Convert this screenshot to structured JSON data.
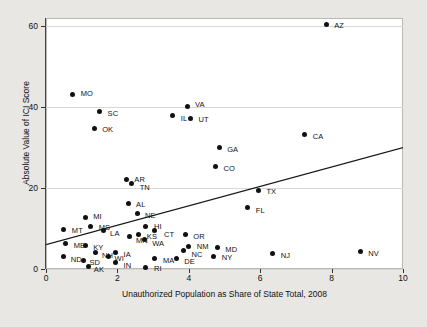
{
  "chart_data": {
    "type": "scatter",
    "title": "",
    "xlabel": "Unauthorized Population as Share of State Total, 2008",
    "ylabel": "Absolute Value of ICI Score",
    "xlim": [
      0,
      10
    ],
    "ylim": [
      0,
      62
    ],
    "xticks": [
      0,
      2,
      4,
      6,
      8,
      10
    ],
    "yticks": [
      0,
      20,
      40,
      60
    ],
    "xtick_labels": [
      "0",
      "2",
      "4",
      "6",
      "8",
      "10"
    ],
    "ytick_labels": [
      "0",
      "20",
      "40",
      "60"
    ],
    "grid": "horizontal",
    "legend": "none",
    "point_label_field": "state",
    "points": [
      {
        "state": "AZ",
        "x": 7.85,
        "y": 60.5,
        "lx": 8,
        "ly": 2
      },
      {
        "state": "MO",
        "x": 0.75,
        "y": 43.0,
        "lx": 8,
        "ly": -1
      },
      {
        "state": "VA",
        "x": 3.95,
        "y": 40.2,
        "lx": 8,
        "ly": -1
      },
      {
        "state": "SC",
        "x": 1.5,
        "y": 38.8,
        "lx": 8,
        "ly": 2
      },
      {
        "state": "IL",
        "x": 3.55,
        "y": 38.0,
        "lx": 8,
        "ly": 4
      },
      {
        "state": "UT",
        "x": 4.05,
        "y": 37.2,
        "lx": 8,
        "ly": 2
      },
      {
        "state": "OK",
        "x": 1.35,
        "y": 34.8,
        "lx": 8,
        "ly": 2
      },
      {
        "state": "CA",
        "x": 7.25,
        "y": 33.2,
        "lx": 8,
        "ly": 2
      },
      {
        "state": "GA",
        "x": 4.85,
        "y": 30.0,
        "lx": 8,
        "ly": 2
      },
      {
        "state": "CO",
        "x": 4.75,
        "y": 25.2,
        "lx": 8,
        "ly": 2
      },
      {
        "state": "AR",
        "x": 2.25,
        "y": 22.0,
        "lx": 8,
        "ly": 0
      },
      {
        "state": "TN",
        "x": 2.4,
        "y": 21.0,
        "lx": 8,
        "ly": 4
      },
      {
        "state": "TX",
        "x": 5.95,
        "y": 19.5,
        "lx": 8,
        "ly": 2
      },
      {
        "state": "AL",
        "x": 2.3,
        "y": 16.2,
        "lx": 8,
        "ly": 2
      },
      {
        "state": "FL",
        "x": 5.65,
        "y": 15.2,
        "lx": 8,
        "ly": 4
      },
      {
        "state": "NE",
        "x": 2.55,
        "y": 13.8,
        "lx": 8,
        "ly": 3
      },
      {
        "state": "MI",
        "x": 1.1,
        "y": 12.8,
        "lx": 8,
        "ly": 0
      },
      {
        "state": "MS",
        "x": 1.25,
        "y": 10.5,
        "lx": 8,
        "ly": 2
      },
      {
        "state": "HI",
        "x": 2.8,
        "y": 10.5,
        "lx": 8,
        "ly": 1
      },
      {
        "state": "CT",
        "x": 3.05,
        "y": 9.5,
        "lx": 9,
        "ly": 4
      },
      {
        "state": "MT",
        "x": 0.5,
        "y": 9.8,
        "lx": 8,
        "ly": 2
      },
      {
        "state": "LA",
        "x": 1.6,
        "y": 9.6,
        "lx": 7,
        "ly": 4
      },
      {
        "state": "KS",
        "x": 2.6,
        "y": 8.5,
        "lx": 8,
        "ly": 2
      },
      {
        "state": "OR",
        "x": 3.9,
        "y": 8.5,
        "lx": 8,
        "ly": 2
      },
      {
        "state": "MN",
        "x": 2.35,
        "y": 8.0,
        "lx": 6,
        "ly": 4
      },
      {
        "state": "WA",
        "x": 2.75,
        "y": 7.2,
        "lx": 8,
        "ly": 4
      },
      {
        "state": "ME",
        "x": 0.55,
        "y": 6.2,
        "lx": 8,
        "ly": 2
      },
      {
        "state": "KY",
        "x": 1.1,
        "y": 5.8,
        "lx": 8,
        "ly": 2
      },
      {
        "state": "NM",
        "x": 4.0,
        "y": 5.5,
        "lx": 8,
        "ly": 0
      },
      {
        "state": "MD",
        "x": 4.8,
        "y": 5.2,
        "lx": 8,
        "ly": 2
      },
      {
        "state": "NV",
        "x": 8.8,
        "y": 4.2,
        "lx": 8,
        "ly": 2
      },
      {
        "state": "NC",
        "x": 3.85,
        "y": 4.5,
        "lx": 8,
        "ly": 4
      },
      {
        "state": "NH",
        "x": 1.4,
        "y": 4.0,
        "lx": 6,
        "ly": 3
      },
      {
        "state": "IA",
        "x": 1.95,
        "y": 4.0,
        "lx": 8,
        "ly": 2
      },
      {
        "state": "NJ",
        "x": 6.35,
        "y": 3.8,
        "lx": 8,
        "ly": 2
      },
      {
        "state": "NY",
        "x": 4.7,
        "y": 3.2,
        "lx": 8,
        "ly": 2
      },
      {
        "state": "ND",
        "x": 0.5,
        "y": 3.0,
        "lx": 7,
        "ly": 3
      },
      {
        "state": "WI",
        "x": 1.75,
        "y": 3.2,
        "lx": 6,
        "ly": 3
      },
      {
        "state": "SD",
        "x": 1.05,
        "y": 2.2,
        "lx": 6,
        "ly": 3
      },
      {
        "state": "MA",
        "x": 3.05,
        "y": 2.5,
        "lx": 8,
        "ly": 2
      },
      {
        "state": "DE",
        "x": 3.65,
        "y": 2.5,
        "lx": 8,
        "ly": 3
      },
      {
        "state": "IN",
        "x": 1.95,
        "y": 1.5,
        "lx": 8,
        "ly": 3
      },
      {
        "state": "AK",
        "x": 1.2,
        "y": 0.6,
        "lx": 5,
        "ly": 3
      },
      {
        "state": "RI",
        "x": 2.8,
        "y": 0.4,
        "lx": 8,
        "ly": 2
      }
    ],
    "trendline": {
      "x_start": 0.0,
      "y_start": 6.0,
      "x_end": 10.0,
      "y_end": 30.0,
      "color": "#1a1a1a"
    }
  }
}
